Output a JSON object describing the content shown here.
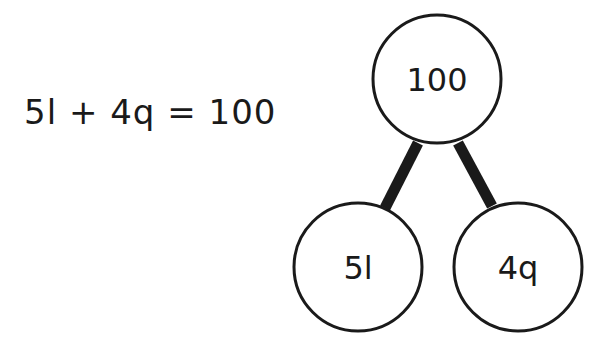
{
  "equation": "5l + 4q = 100",
  "bond": {
    "whole": "100",
    "parts": [
      "5l",
      "4q"
    ]
  },
  "colors": {
    "stroke": "#1a1a1a",
    "background": "#ffffff"
  }
}
